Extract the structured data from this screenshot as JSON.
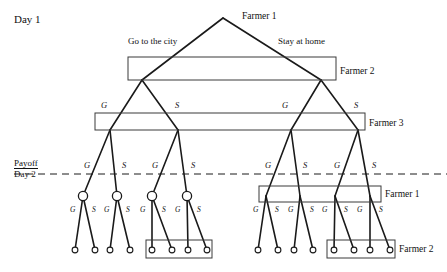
{
  "figure": {
    "type": "game-tree",
    "title_labels": {
      "day1": "Day 1",
      "payoff": "Payoff",
      "day2": "Day 2"
    },
    "root": {
      "x": 223,
      "y": 18,
      "player": "Farmer 1",
      "label": "Farmer 1"
    },
    "root_actions": [
      {
        "label": "Go to the city",
        "x": 128,
        "y": 37,
        "side": "left"
      },
      {
        "label": "Stay at home",
        "x": 278,
        "y": 37,
        "side": "right"
      }
    ],
    "information_sets": [
      {
        "name": "farmer-2-day1",
        "label": "Farmer 2",
        "x": 128,
        "y": 57,
        "w": 208,
        "h": 23,
        "label_x": 340,
        "label_y": 67
      },
      {
        "name": "farmer-3-day1",
        "label": "Farmer 3",
        "x": 95,
        "y": 113,
        "w": 270,
        "h": 17,
        "label_x": 369,
        "label_y": 119
      },
      {
        "name": "farmer-1-day2-right",
        "label": "Farmer 1",
        "x": 259,
        "y": 186,
        "w": 122,
        "h": 16,
        "label_x": 385,
        "label_y": 190
      },
      {
        "name": "farmer-2-day2-left",
        "label": "",
        "x": 146,
        "y": 240,
        "w": 66,
        "h": 18,
        "label_x": null,
        "label_y": null
      },
      {
        "name": "farmer-2-day2-right",
        "label": "Farmer 2",
        "x": 327,
        "y": 240,
        "w": 68,
        "h": 18,
        "label_x": 399,
        "label_y": 245
      }
    ],
    "nodes": {
      "day1_level2": [
        {
          "name": "farmer-2-left",
          "x": 142,
          "y": 80
        },
        {
          "name": "farmer-2-right",
          "x": 321,
          "y": 80
        }
      ],
      "day1_level3": [
        {
          "name": "farmer-3-a",
          "x": 110,
          "y": 130,
          "action": "G"
        },
        {
          "name": "farmer-3-b",
          "x": 178,
          "y": 130,
          "action": "S"
        },
        {
          "name": "farmer-3-c",
          "x": 291,
          "y": 130,
          "action": "G"
        },
        {
          "name": "farmer-3-d",
          "x": 358,
          "y": 130,
          "action": "S"
        }
      ],
      "day2_decision": [
        {
          "name": "day2-node-1",
          "x": 83,
          "y": 196,
          "action": "G",
          "circled": true
        },
        {
          "name": "day2-node-2",
          "x": 117,
          "y": 196,
          "action": "S",
          "circled": true
        },
        {
          "name": "day2-node-3",
          "x": 152,
          "y": 196,
          "action": "G",
          "circled": true
        },
        {
          "name": "day2-node-4",
          "x": 187,
          "y": 196,
          "action": "S",
          "circled": true
        },
        {
          "name": "day2-node-5",
          "x": 266,
          "y": 196,
          "action": "G",
          "circled": false
        },
        {
          "name": "day2-node-6",
          "x": 300,
          "y": 196,
          "action": "S",
          "circled": false
        },
        {
          "name": "day2-node-7",
          "x": 335,
          "y": 196,
          "action": "G",
          "circled": false
        },
        {
          "name": "day2-node-8",
          "x": 370,
          "y": 196,
          "action": "S",
          "circled": false
        }
      ],
      "terminal": [
        {
          "name": "terminal-1",
          "x": 75,
          "y": 250,
          "circled": true
        },
        {
          "name": "terminal-2",
          "x": 95,
          "y": 250,
          "circled": true
        },
        {
          "name": "terminal-3",
          "x": 110,
          "y": 250,
          "circled": true
        },
        {
          "name": "terminal-4",
          "x": 130,
          "y": 250,
          "circled": true
        },
        {
          "name": "terminal-5",
          "x": 152,
          "y": 250,
          "circled": false
        },
        {
          "name": "terminal-6",
          "x": 172,
          "y": 250,
          "circled": false
        },
        {
          "name": "terminal-7",
          "x": 188,
          "y": 250,
          "circled": false
        },
        {
          "name": "terminal-8",
          "x": 207,
          "y": 250,
          "circled": false
        },
        {
          "name": "terminal-9",
          "x": 258,
          "y": 250,
          "circled": true
        },
        {
          "name": "terminal-10",
          "x": 278,
          "y": 250,
          "circled": true
        },
        {
          "name": "terminal-11",
          "x": 294,
          "y": 250,
          "circled": true
        },
        {
          "name": "terminal-12",
          "x": 313,
          "y": 250,
          "circled": true
        },
        {
          "name": "terminal-13",
          "x": 334,
          "y": 250,
          "circled": false
        },
        {
          "name": "terminal-14",
          "x": 354,
          "y": 250,
          "circled": false
        },
        {
          "name": "terminal-15",
          "x": 370,
          "y": 250,
          "circled": false
        },
        {
          "name": "terminal-16",
          "x": 390,
          "y": 250,
          "circled": false
        }
      ]
    },
    "action_labels_level3": [
      {
        "text": "G",
        "x": 101,
        "y": 101
      },
      {
        "text": "S",
        "x": 175,
        "y": 101
      },
      {
        "text": "G",
        "x": 282,
        "y": 101
      },
      {
        "text": "S",
        "x": 354,
        "y": 101
      }
    ],
    "action_labels_day2_top": [
      {
        "text": "G",
        "x": 84,
        "y": 161
      },
      {
        "text": "S",
        "x": 122,
        "y": 161
      },
      {
        "text": "G",
        "x": 152,
        "y": 161
      },
      {
        "text": "S",
        "x": 191,
        "y": 161
      },
      {
        "text": "G",
        "x": 265,
        "y": 161
      },
      {
        "text": "S",
        "x": 303,
        "y": 161
      },
      {
        "text": "G",
        "x": 334,
        "y": 161
      },
      {
        "text": "S",
        "x": 372,
        "y": 161
      }
    ],
    "action_labels_day2_bottom": [
      {
        "text": "G",
        "x": 70,
        "y": 206
      },
      {
        "text": "S",
        "x": 92,
        "y": 206
      },
      {
        "text": "G",
        "x": 104,
        "y": 206
      },
      {
        "text": "S",
        "x": 126,
        "y": 206
      },
      {
        "text": "G",
        "x": 140,
        "y": 206
      },
      {
        "text": "S",
        "x": 162,
        "y": 206
      },
      {
        "text": "G",
        "x": 175,
        "y": 206
      },
      {
        "text": "S",
        "x": 197,
        "y": 206
      },
      {
        "text": "G",
        "x": 253,
        "y": 206
      },
      {
        "text": "S",
        "x": 275,
        "y": 206
      },
      {
        "text": "G",
        "x": 288,
        "y": 206
      },
      {
        "text": "S",
        "x": 310,
        "y": 206
      },
      {
        "text": "G",
        "x": 322,
        "y": 206
      },
      {
        "text": "S",
        "x": 344,
        "y": 206
      },
      {
        "text": "G",
        "x": 357,
        "y": 206
      },
      {
        "text": "S",
        "x": 379,
        "y": 206
      }
    ],
    "divider": {
      "name": "payoff-day2-divider",
      "y": 174,
      "x1": 14,
      "x2": 447,
      "style": "dashed"
    },
    "colors": {
      "stroke": "#1a1a1a",
      "box_stroke": "#3a3a3a",
      "background": "#ffffff"
    }
  }
}
